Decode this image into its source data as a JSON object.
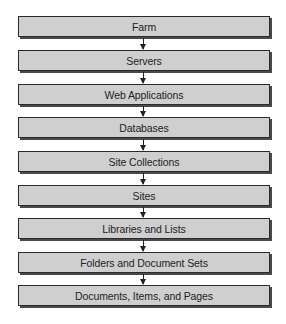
{
  "diagram": {
    "title": "",
    "type": "vertical-hierarchy-flow",
    "colors": {
      "box_fill": "#cfcfcf",
      "box_border": "#2a2a2a",
      "arrow": "#222222",
      "background": "#ffffff"
    },
    "levels": [
      {
        "label": "Farm"
      },
      {
        "label": "Servers"
      },
      {
        "label": "Web Applications"
      },
      {
        "label": "Databases"
      },
      {
        "label": "Site Collections"
      },
      {
        "label": "Sites"
      },
      {
        "label": "Libraries and Lists"
      },
      {
        "label": "Folders and Document Sets"
      },
      {
        "label": "Documents, Items, and Pages"
      }
    ],
    "connectors": [
      {
        "from": "Farm",
        "to": "Servers"
      },
      {
        "from": "Servers",
        "to": "Web Applications"
      },
      {
        "from": "Web Applications",
        "to": "Databases"
      },
      {
        "from": "Databases",
        "to": "Site Collections"
      },
      {
        "from": "Site Collections",
        "to": "Sites"
      },
      {
        "from": "Sites",
        "to": "Libraries and Lists"
      },
      {
        "from": "Libraries and Lists",
        "to": "Folders and Document Sets"
      },
      {
        "from": "Folders and Document Sets",
        "to": "Documents, Items, and Pages"
      }
    ]
  }
}
